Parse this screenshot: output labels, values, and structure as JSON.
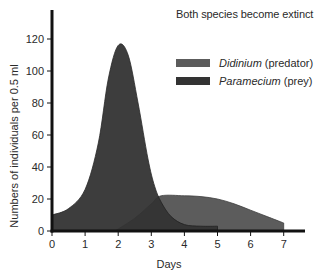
{
  "chart_data": {
    "type": "area",
    "title": "",
    "annotation": "Both species become extinct",
    "xlabel": "Days",
    "ylabel": "Numbers of individuals per 0.5 ml",
    "xlim": [
      0,
      7.6
    ],
    "ylim": [
      0,
      135
    ],
    "xticks": [
      0,
      1,
      2,
      3,
      4,
      5,
      6,
      7
    ],
    "yticks": [
      0,
      20,
      40,
      60,
      80,
      100,
      120
    ],
    "grid": false,
    "legend_position": "upper right",
    "series": [
      {
        "name": "Didinium",
        "qualifier": "(predator)",
        "color": "#5c5c5c",
        "x": [
          1.9,
          2.5,
          3.0,
          3.3,
          4.0,
          4.5,
          5.0,
          5.5,
          6.0,
          6.5,
          7.0,
          7.0
        ],
        "values": [
          0,
          8,
          17,
          22,
          22,
          21.5,
          20,
          17,
          13,
          9,
          5,
          0
        ]
      },
      {
        "name": "Paramecium",
        "qualifier": "(prey)",
        "color": "#333333",
        "x": [
          0,
          0.5,
          1.0,
          1.4,
          1.7,
          2.0,
          2.3,
          2.6,
          2.9,
          3.1,
          3.3,
          3.6,
          4.0,
          4.5,
          5.0,
          5.0
        ],
        "values": [
          10,
          14,
          26,
          55,
          95,
          116,
          110,
          80,
          45,
          28,
          18,
          9,
          4,
          3,
          3,
          0
        ]
      }
    ]
  },
  "legend": {
    "items": [
      {
        "name": "Didinium",
        "qualifier": "(predator)"
      },
      {
        "name": "Paramecium",
        "qualifier": "(prey)"
      }
    ]
  }
}
